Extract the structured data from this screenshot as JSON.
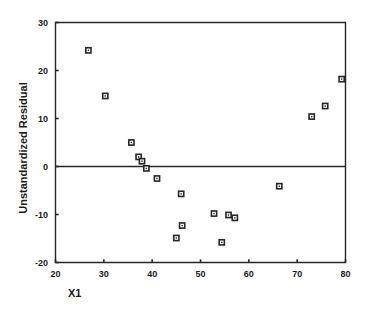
{
  "chart_data": {
    "type": "scatter",
    "title": "",
    "xlabel": "X1",
    "ylabel": "Unstandardized Residual",
    "xlim": [
      20,
      80
    ],
    "ylim": [
      -20,
      30
    ],
    "xticks": [
      20,
      30,
      40,
      50,
      60,
      70,
      80
    ],
    "yticks": [
      30,
      20,
      10,
      0,
      -10,
      -20
    ],
    "xtick_labels": [
      "20",
      "30",
      "40",
      "50",
      "60",
      "70",
      "80"
    ],
    "ytick_labels": [
      "30",
      "20",
      "10",
      "0",
      "-10",
      "-20"
    ],
    "grid": false,
    "legend": false,
    "reference_lines": [
      {
        "axis": "y",
        "value": 0
      }
    ],
    "marker": "open-square",
    "points": [
      {
        "x": 26.8,
        "y": 24.2
      },
      {
        "x": 30.3,
        "y": 14.7
      },
      {
        "x": 35.7,
        "y": 5.0
      },
      {
        "x": 37.2,
        "y": 2.0
      },
      {
        "x": 37.9,
        "y": 1.1
      },
      {
        "x": 38.8,
        "y": -0.4
      },
      {
        "x": 41.0,
        "y": -2.5
      },
      {
        "x": 45.0,
        "y": -14.9
      },
      {
        "x": 46.0,
        "y": -5.7
      },
      {
        "x": 46.2,
        "y": -12.3
      },
      {
        "x": 52.8,
        "y": -9.8
      },
      {
        "x": 54.4,
        "y": -15.8
      },
      {
        "x": 55.8,
        "y": -10.1
      },
      {
        "x": 57.1,
        "y": -10.7
      },
      {
        "x": 66.3,
        "y": -4.1
      },
      {
        "x": 73.0,
        "y": 10.4
      },
      {
        "x": 75.8,
        "y": 12.6
      },
      {
        "x": 79.2,
        "y": 18.2
      }
    ]
  },
  "colors": {
    "axis": "#262626",
    "marker_stroke": "#262626",
    "marker_fill": "#ffffff",
    "background": "#ffffff"
  }
}
